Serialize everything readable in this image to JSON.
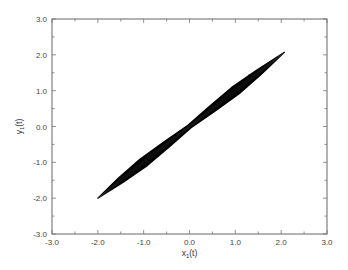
{
  "chart_data": {
    "type": "scatter",
    "title": "",
    "xlabel": "x1(t)",
    "ylabel": "y1(t)",
    "xlabel_parts": {
      "base": "x",
      "sub": "1",
      "rest": "(t)"
    },
    "ylabel_parts": {
      "base": "y",
      "sub": "1",
      "rest": "(t)"
    },
    "xlim": [
      -3.0,
      3.0
    ],
    "ylim": [
      -3.0,
      3.0
    ],
    "xticks": [
      "-3.0",
      "-2.0",
      "-1.0",
      "0.0",
      "1.0",
      "2.0",
      "3.0"
    ],
    "yticks": [
      "-3.0",
      "-2.0",
      "-1.0",
      "0.0",
      "1.0",
      "2.0",
      "3.0"
    ],
    "minor_tick_step": 0.5,
    "grid": false,
    "legend": null,
    "series": [
      {
        "name": "trajectory",
        "color": "#000000",
        "x": [
          -2.0,
          -1.5,
          -1.0,
          -0.5,
          0.0,
          0.5,
          1.0,
          1.5,
          2.07
        ],
        "y": [
          -2.0,
          -1.5,
          -1.0,
          -0.5,
          0.0,
          0.5,
          1.0,
          1.5,
          2.07
        ],
        "band_halfwidth": [
          0.0,
          0.08,
          0.12,
          0.09,
          0.05,
          0.09,
          0.12,
          0.08,
          0.0
        ]
      }
    ]
  }
}
